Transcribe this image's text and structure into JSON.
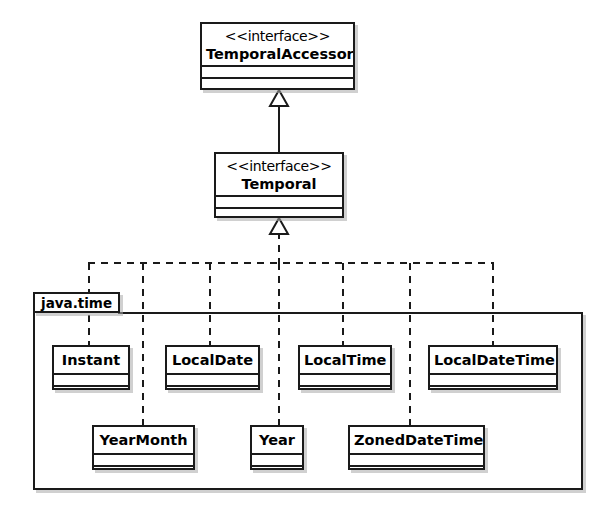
{
  "diagram": {
    "type": "uml-class-diagram",
    "stereotype_label": "<<interface>>",
    "interfaces": [
      {
        "id": "temporal-accessor",
        "name": "TemporalAccessor",
        "stereotype": "<<interface>>",
        "x": 200,
        "y": 22,
        "w": 155,
        "h": 68
      },
      {
        "id": "temporal",
        "name": "Temporal",
        "stereotype": "<<interface>>",
        "x": 214,
        "y": 152,
        "w": 130,
        "h": 66
      }
    ],
    "package": {
      "name": "java.time",
      "x": 33,
      "y": 312,
      "w": 550,
      "h": 178,
      "tab": {
        "x": 33,
        "y": 292,
        "w": 87,
        "h": 21
      }
    },
    "classes": [
      {
        "id": "instant",
        "name": "Instant",
        "x": 52,
        "y": 345,
        "w": 78,
        "h": 45
      },
      {
        "id": "local-date",
        "name": "LocalDate",
        "x": 165,
        "y": 345,
        "w": 95,
        "h": 45
      },
      {
        "id": "local-time",
        "name": "LocalTime",
        "x": 298,
        "y": 345,
        "w": 94,
        "h": 45
      },
      {
        "id": "local-date-time",
        "name": "LocalDateTime",
        "x": 428,
        "y": 345,
        "w": 130,
        "h": 45
      },
      {
        "id": "year-month",
        "name": "YearMonth",
        "x": 92,
        "y": 425,
        "w": 103,
        "h": 45
      },
      {
        "id": "year",
        "name": "Year",
        "x": 250,
        "y": 425,
        "w": 54,
        "h": 45
      },
      {
        "id": "zoned-date-time",
        "name": "ZonedDateTime",
        "x": 348,
        "y": 425,
        "w": 137,
        "h": 45
      }
    ],
    "relationships": [
      {
        "kind": "generalization",
        "from": "temporal",
        "to": "temporal-accessor",
        "line": "solid",
        "arrow": "hollow-triangle"
      },
      {
        "kind": "realization",
        "from": "instant",
        "to": "temporal",
        "line": "dashed",
        "arrow": "hollow-triangle"
      },
      {
        "kind": "realization",
        "from": "local-date",
        "to": "temporal",
        "line": "dashed",
        "arrow": "hollow-triangle"
      },
      {
        "kind": "realization",
        "from": "local-time",
        "to": "temporal",
        "line": "dashed",
        "arrow": "hollow-triangle"
      },
      {
        "kind": "realization",
        "from": "local-date-time",
        "to": "temporal",
        "line": "dashed",
        "arrow": "hollow-triangle"
      },
      {
        "kind": "realization",
        "from": "year-month",
        "to": "temporal",
        "line": "dashed",
        "arrow": "hollow-triangle"
      },
      {
        "kind": "realization",
        "from": "year",
        "to": "temporal",
        "line": "dashed",
        "arrow": "hollow-triangle"
      },
      {
        "kind": "realization",
        "from": "zoned-date-time",
        "to": "temporal",
        "line": "dashed",
        "arrow": "hollow-triangle"
      }
    ],
    "colors": {
      "stroke": "#1a1a1a",
      "fill": "#ffffff",
      "shadow": "#aaaaaa",
      "background": "#ffffff",
      "text": "#000000"
    }
  }
}
